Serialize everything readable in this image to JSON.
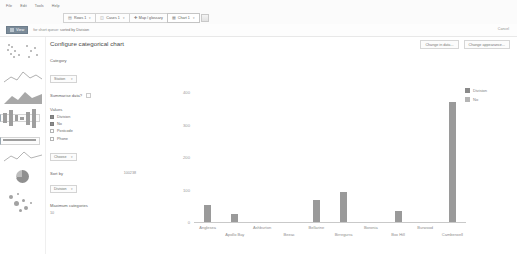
{
  "menubar": {
    "items": [
      "File",
      "Edit",
      "Tools",
      "Help"
    ]
  },
  "toolbar": {
    "buttons": [
      {
        "label": "Rows 1",
        "icon": "rows-icon",
        "caret": "▾"
      },
      {
        "label": "Cases 1",
        "icon": "cases-icon",
        "caret": "▾"
      },
      {
        "label": "Map / glossary",
        "icon": "map-icon",
        "caret": ""
      },
      {
        "label": "Chart 1",
        "icon": "chart-icon",
        "caret": "▾"
      }
    ],
    "panel_icon": "panel-toggle-icon"
  },
  "viewbar": {
    "chip_label": "View",
    "chip_icon": "view-grid-icon",
    "filter_prefix": "for short queue:",
    "filter_value": "sorted by Division",
    "cancel_label": "Cancel"
  },
  "gallery": {
    "items": [
      {
        "name": "scatter-chart-thumb",
        "type": "scatter",
        "selected": false
      },
      {
        "name": "area-chart-thumb",
        "type": "area",
        "selected": false
      },
      {
        "name": "mountain-chart-thumb",
        "type": "area-filled",
        "selected": false
      },
      {
        "name": "bar-chart-thumb",
        "type": "bar",
        "selected": true
      },
      {
        "name": "horizontal-bar-chart-thumb",
        "type": "hbar",
        "selected": true
      },
      {
        "name": "line-chart-thumb",
        "type": "line",
        "selected": false
      },
      {
        "name": "pie-chart-thumb",
        "type": "pie",
        "selected": false
      },
      {
        "name": "bubble-chart-thumb",
        "type": "bubble",
        "selected": false
      }
    ]
  },
  "config": {
    "title": "Configure categorical chart",
    "category_label": "Category",
    "category_value": "Station",
    "summarise_label": "Summarise data?",
    "summarise_checked": false,
    "values_label": "Values",
    "values": [
      {
        "label": "Division",
        "checked": true
      },
      {
        "label": "No",
        "checked": true
      },
      {
        "label": "Postcode",
        "checked": false
      },
      {
        "label": "Phone",
        "checked": false
      }
    ],
    "values_more": "Choose",
    "sort_label": "Sort by",
    "sort_value_right": "100238",
    "sort_select": "Division",
    "max_categories_label": "Maximum categories",
    "max_categories_value": "10",
    "caret": "▾"
  },
  "actions": {
    "change_data": "Change in data...",
    "change_appearance": "Change appearance..."
  },
  "chart_data": {
    "type": "bar",
    "title": "",
    "xlabel": "",
    "ylabel": "",
    "ylim": [
      0,
      400
    ],
    "yticks": [
      0,
      100,
      200,
      300,
      400
    ],
    "ytick_labels": [
      "0",
      "100",
      "200",
      "300",
      "400"
    ],
    "grid": false,
    "legend_position": "right",
    "categories": [
      "Anglesea",
      "Apollo Bay",
      "Ashburton",
      "Beeac",
      "Bellarine",
      "Birregurra",
      "Boronia",
      "Box Hill",
      "Burwood",
      "Camberwell"
    ],
    "series": [
      {
        "name": "Division",
        "color": "#9a9a9a",
        "values": [
          53,
          26,
          0,
          0,
          68,
          93,
          0,
          34,
          0,
          88
        ]
      }
    ],
    "legend": [
      {
        "label": "Division",
        "color": "#8a8a8a"
      },
      {
        "label": "No",
        "color": "#b5b5b5"
      }
    ],
    "extra_bar": {
      "label": "Camberwell",
      "value": 370,
      "color": "#9a9a9a"
    }
  }
}
